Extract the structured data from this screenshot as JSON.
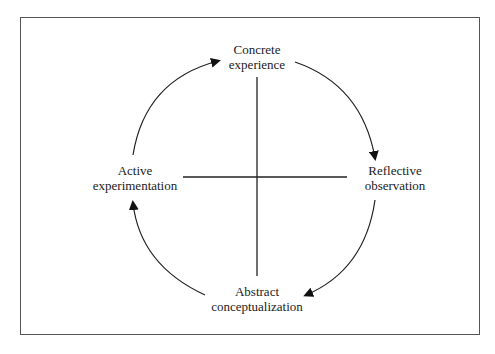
{
  "diagram": {
    "type": "cycle",
    "nodes": [
      {
        "id": "concrete",
        "line1": "Concrete",
        "line2": "experience",
        "position": "top"
      },
      {
        "id": "reflective",
        "line1": "Reflective",
        "line2": "observation",
        "position": "right"
      },
      {
        "id": "abstract",
        "line1": "Abstract",
        "line2": "conceptualization",
        "position": "bottom"
      },
      {
        "id": "active",
        "line1": "Active",
        "line2": "experimentation",
        "position": "left"
      }
    ],
    "edges": [
      {
        "from": "concrete",
        "to": "reflective"
      },
      {
        "from": "reflective",
        "to": "abstract"
      },
      {
        "from": "abstract",
        "to": "active"
      },
      {
        "from": "active",
        "to": "concrete"
      }
    ],
    "axes": {
      "vertical": "concrete-abstract",
      "horizontal": "active-reflective"
    },
    "colors": {
      "stroke": "#222222",
      "frame": "#555555",
      "background": "#ffffff"
    }
  }
}
